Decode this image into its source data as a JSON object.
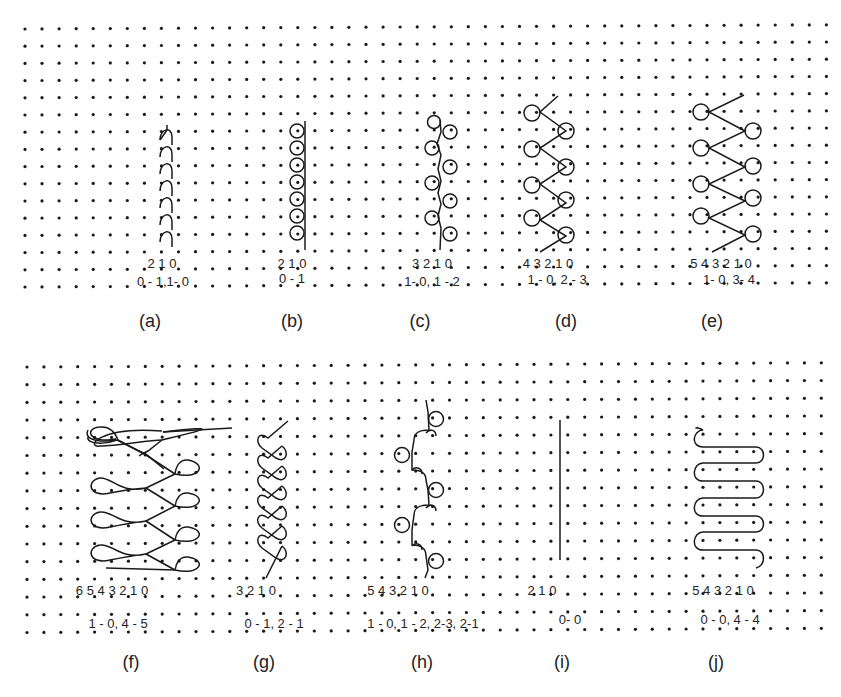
{
  "figure": {
    "width": 841,
    "height": 697,
    "colors": {
      "ink": "#1a1a1a",
      "dot": "#1a1a1a",
      "background": "#ffffff"
    },
    "grids": [
      {
        "name": "top-grid",
        "x0": 25,
        "y0": 29,
        "dx": 17.05,
        "dy": 17.2,
        "cols": 48,
        "rows": 16
      },
      {
        "name": "bottom-grid",
        "x0": 27,
        "y0": 367,
        "dx": 16.9,
        "dy": 17.7,
        "cols": 48,
        "rows": 16
      }
    ],
    "panels": [
      {
        "id": "a",
        "caption": "(a)",
        "caption_x": 150,
        "caption_y": 327,
        "digits": "2 1 0",
        "digits_x": 162,
        "digits_y": 268,
        "notation": "0 - 1,1- 0",
        "notation_x": 163,
        "notation_y": 286
      },
      {
        "id": "b",
        "caption": "(b)",
        "caption_x": 292,
        "caption_y": 327,
        "digits": "2 1 0",
        "digits_x": 292,
        "digits_y": 268,
        "notation": "0 - 1",
        "notation_x": 292,
        "notation_y": 283
      },
      {
        "id": "c",
        "caption": "(c)",
        "caption_x": 420,
        "caption_y": 327,
        "digits": "3 2 1 0",
        "digits_x": 432,
        "digits_y": 268,
        "notation": "1- 0, 1 - 2",
        "notation_x": 432,
        "notation_y": 286
      },
      {
        "id": "d",
        "caption": "(d)",
        "caption_x": 566,
        "caption_y": 327,
        "digits": "4 3 2 1 0",
        "digits_x": 548,
        "digits_y": 268,
        "notation": "1 - 0, 2 - 3",
        "notation_x": 557,
        "notation_y": 284
      },
      {
        "id": "e",
        "caption": "(e)",
        "caption_x": 712,
        "caption_y": 327,
        "digits": "5 4 3 2 1 0",
        "digits_x": 721,
        "digits_y": 268,
        "notation": "1- 0, 3- 4",
        "notation_x": 729,
        "notation_y": 284
      },
      {
        "id": "f",
        "caption": "(f)",
        "caption_x": 131,
        "caption_y": 668,
        "digits": "6 5 4 3 2 1 0",
        "digits_x": 112,
        "digits_y": 595,
        "notation": "1 - 0,  4 - 5",
        "notation_x": 118,
        "notation_y": 628
      },
      {
        "id": "g",
        "caption": "(g)",
        "caption_x": 264,
        "caption_y": 668,
        "digits": "3 2 1 0",
        "digits_x": 256,
        "digits_y": 595,
        "notation": "0 - 1, 2 - 1",
        "notation_x": 274,
        "notation_y": 628
      },
      {
        "id": "h",
        "caption": "(h)",
        "caption_x": 422,
        "caption_y": 668,
        "digits": "5 4 3 2 1 0",
        "digits_x": 398,
        "digits_y": 595,
        "notation": "1 - 0, 1 - 2, 2-3, 2-1",
        "notation_x": 423,
        "notation_y": 628
      },
      {
        "id": "i",
        "caption": "(i)",
        "caption_x": 562,
        "caption_y": 668,
        "digits": "2 1 0",
        "digits_x": 542,
        "digits_y": 595,
        "notation": "0- 0",
        "notation_x": 570,
        "notation_y": 624
      },
      {
        "id": "j",
        "caption": "(j)",
        "caption_x": 716,
        "caption_y": 668,
        "digits": "5 4 3 2 1 0",
        "digits_x": 723,
        "digits_y": 595,
        "notation": "0 - 0,   4 - 4",
        "notation_x": 730,
        "notation_y": 624
      }
    ]
  }
}
